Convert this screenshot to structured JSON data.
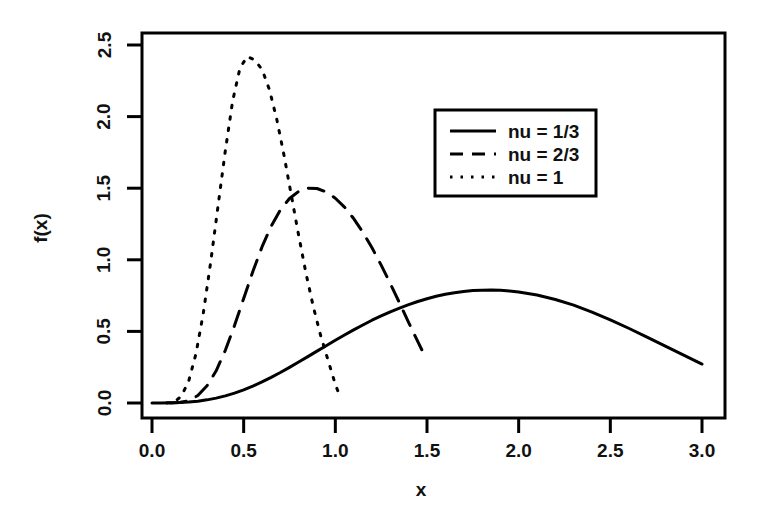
{
  "chart_data": {
    "type": "line",
    "title": "",
    "xlabel": "x",
    "ylabel": "f(x)",
    "xlim": [
      0.0,
      3.0
    ],
    "ylim": [
      0.0,
      2.5
    ],
    "xticks": [
      "0.0",
      "0.5",
      "1.0",
      "1.5",
      "2.0",
      "2.5",
      "3.0"
    ],
    "xtick_values": [
      0.0,
      0.5,
      1.0,
      1.5,
      2.0,
      2.5,
      3.0
    ],
    "yticks": [
      "0.0",
      "0.5",
      "1.0",
      "1.5",
      "2.0",
      "2.5"
    ],
    "ytick_values": [
      0.0,
      0.5,
      1.0,
      1.5,
      2.0,
      2.5
    ],
    "grid": false,
    "legend_position": "upper right",
    "series": [
      {
        "name": "nu = 1/3",
        "style": "solid",
        "color": "#000000",
        "peak_x": 1.62,
        "peak_y": 0.8,
        "x": [
          0.0,
          0.05,
          0.1,
          0.15,
          0.2,
          0.25,
          0.3,
          0.35,
          0.4,
          0.45,
          0.5,
          0.55,
          0.6,
          0.65,
          0.7,
          0.75,
          0.8,
          0.85,
          0.9,
          0.95,
          1.0,
          1.05,
          1.1,
          1.15,
          1.2,
          1.25,
          1.3,
          1.35,
          1.4,
          1.45,
          1.5,
          1.55,
          1.6,
          1.65,
          1.7,
          1.75,
          1.8,
          1.85,
          1.9,
          1.95,
          2.0,
          2.1,
          2.2,
          2.3,
          2.4,
          2.5,
          2.6,
          2.7,
          2.8,
          2.9,
          3.0
        ],
        "values": [
          0.0,
          0.0,
          0.001,
          0.003,
          0.007,
          0.013,
          0.022,
          0.034,
          0.05,
          0.069,
          0.092,
          0.118,
          0.147,
          0.179,
          0.213,
          0.249,
          0.286,
          0.324,
          0.362,
          0.4,
          0.438,
          0.475,
          0.511,
          0.545,
          0.578,
          0.608,
          0.637,
          0.663,
          0.687,
          0.709,
          0.728,
          0.745,
          0.759,
          0.77,
          0.779,
          0.785,
          0.788,
          0.789,
          0.787,
          0.782,
          0.775,
          0.754,
          0.723,
          0.683,
          0.635,
          0.581,
          0.522,
          0.46,
          0.397,
          0.334,
          0.272
        ]
      },
      {
        "name": "nu = 2/3",
        "style": "dashed",
        "color": "#000000",
        "peak_x": 0.86,
        "peak_y": 1.6,
        "x": [
          0.1,
          0.15,
          0.2,
          0.25,
          0.3,
          0.35,
          0.4,
          0.45,
          0.5,
          0.55,
          0.6,
          0.65,
          0.7,
          0.75,
          0.8,
          0.85,
          0.9,
          0.95,
          1.0,
          1.05,
          1.1,
          1.15,
          1.2,
          1.25,
          1.3,
          1.35,
          1.4,
          1.45,
          1.48
        ],
        "values": [
          0.0,
          0.003,
          0.016,
          0.052,
          0.12,
          0.225,
          0.368,
          0.541,
          0.73,
          0.918,
          1.09,
          1.235,
          1.348,
          1.428,
          1.478,
          1.5,
          1.498,
          1.474,
          1.43,
          1.368,
          1.288,
          1.193,
          1.084,
          0.963,
          0.834,
          0.699,
          0.562,
          0.428,
          0.35
        ]
      },
      {
        "name": "nu = 1",
        "style": "dotted",
        "color": "#000000",
        "peak_x": 0.58,
        "peak_y": 2.4,
        "x": [
          0.08,
          0.12,
          0.16,
          0.2,
          0.24,
          0.28,
          0.32,
          0.36,
          0.4,
          0.44,
          0.48,
          0.52,
          0.56,
          0.6,
          0.64,
          0.68,
          0.72,
          0.76,
          0.8,
          0.84,
          0.88,
          0.92,
          0.96,
          1.0,
          1.03
        ],
        "values": [
          0.0,
          0.006,
          0.047,
          0.152,
          0.345,
          0.628,
          0.983,
          1.374,
          1.762,
          2.11,
          2.34,
          2.42,
          2.395,
          2.33,
          2.19,
          1.985,
          1.73,
          1.45,
          1.17,
          0.905,
          0.672,
          0.47,
          0.3,
          0.13,
          0.03
        ]
      }
    ]
  },
  "legend": {
    "entries": [
      {
        "label": "nu = 1/3",
        "style": "solid"
      },
      {
        "label": "nu = 2/3",
        "style": "dashed"
      },
      {
        "label": "nu = 1",
        "style": "dotted"
      }
    ]
  },
  "axes": {
    "x_title": "x",
    "y_title": "f(x)",
    "x_tick_labels": [
      "0.0",
      "0.5",
      "1.0",
      "1.5",
      "2.0",
      "2.5",
      "3.0"
    ],
    "y_tick_labels": [
      "0.0",
      "0.5",
      "1.0",
      "1.5",
      "2.0",
      "2.5"
    ]
  },
  "style": {
    "line_color": "#000000",
    "frame_color": "#000000",
    "background": "#ffffff"
  }
}
